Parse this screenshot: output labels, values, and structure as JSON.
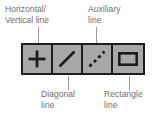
{
  "figure": {
    "type": "annotated-toolbar-diagram",
    "colors": {
      "toolbar_border": "#1d1d1d",
      "button_face": "#a8a8a8",
      "icon": "#1d1d1d",
      "label_text": "#6e6e6e",
      "leader_line": "#9a9a9a",
      "background": "#ffffff"
    }
  },
  "toolbar": {
    "name": "line-tools-toolbar",
    "buttons": [
      {
        "id": "horizontal-vertical-line",
        "icon": "plus-cross-icon",
        "label_line1": "Horizontal/",
        "label_line2": "Vertical line",
        "callout_position": "above-left"
      },
      {
        "id": "diagonal-line",
        "icon": "diagonal-line-icon",
        "label_line1": "Diagonal",
        "label_line2": "line",
        "callout_position": "below-left"
      },
      {
        "id": "auxiliary-line",
        "icon": "dashed-diagonal-line-icon",
        "label_line1": "Auxiliary",
        "label_line2": "line",
        "callout_position": "above-right"
      },
      {
        "id": "rectangle-line",
        "icon": "rectangle-outline-icon",
        "label_line1": "Rectangle",
        "label_line2": "line",
        "callout_position": "below-right"
      }
    ]
  },
  "callouts": {
    "horizontal_vertical": {
      "line1": "Horizontal/",
      "line2": "Vertical line"
    },
    "auxiliary": {
      "line1": "Auxiliary",
      "line2": "line"
    },
    "diagonal": {
      "line1": "Diagonal",
      "line2": "line"
    },
    "rectangle": {
      "line1": "Rectangle",
      "line2": "line"
    }
  }
}
